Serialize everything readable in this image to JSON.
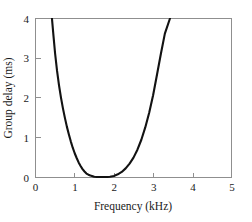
{
  "chart_data": {
    "type": "line",
    "title": "",
    "xlabel": "Frequency (kHz)",
    "ylabel": "Group delay (ms)",
    "xlim": [
      0,
      5
    ],
    "ylim": [
      0,
      4
    ],
    "xticks": [
      "0",
      "1",
      "2",
      "3",
      "4",
      "5"
    ],
    "xtick_values": [
      0,
      1,
      2,
      3,
      4,
      5
    ],
    "yticks": [
      "0",
      "1",
      "2",
      "3",
      "4"
    ],
    "ytick_values": [
      0,
      1,
      2,
      3,
      4
    ],
    "grid": false,
    "legend": false,
    "legend_position": "none",
    "series": [
      {
        "name": "Group delay",
        "color": "#121212",
        "x": [
          0.42,
          0.46,
          0.5,
          0.55,
          0.6,
          0.65,
          0.7,
          0.75,
          0.8,
          0.85,
          0.9,
          0.95,
          1.0,
          1.05,
          1.1,
          1.15,
          1.2,
          1.25,
          1.3,
          1.35,
          1.4,
          1.5,
          1.6,
          1.7,
          1.8,
          1.9,
          2.0,
          2.1,
          2.2,
          2.3,
          2.4,
          2.5,
          2.6,
          2.7,
          2.8,
          2.9,
          3.0,
          3.1,
          3.2,
          3.3,
          3.43
        ],
        "y": [
          4.0,
          3.55,
          3.12,
          2.68,
          2.32,
          2.01,
          1.74,
          1.5,
          1.28,
          1.09,
          0.91,
          0.75,
          0.61,
          0.49,
          0.38,
          0.29,
          0.21,
          0.15,
          0.1,
          0.07,
          0.05,
          0.02,
          0.01,
          0.01,
          0.01,
          0.02,
          0.04,
          0.08,
          0.14,
          0.23,
          0.35,
          0.5,
          0.7,
          0.95,
          1.26,
          1.63,
          2.07,
          2.59,
          3.12,
          3.62,
          4.0
        ]
      }
    ],
    "annotations": []
  },
  "figure": {
    "background_color": "#ffffff",
    "frame_color": "#8f8f8f",
    "curve_color": "#121212"
  }
}
